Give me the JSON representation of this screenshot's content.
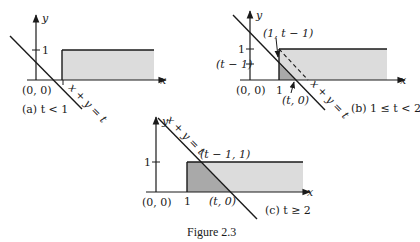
{
  "figure": {
    "caption": "Figure 2.3",
    "colors": {
      "ink": "#1a1a1a",
      "light_shade": "#dcdcdc",
      "dark_shade": "#a9a9a9"
    },
    "panels": [
      {
        "id": "a",
        "caption": "(a) t < 1",
        "axis_x_label": "x",
        "axis_y_label": "y",
        "origin_label": "(0, 0)",
        "y_tick_labels": [
          "1"
        ],
        "x_tick_labels": [
          "1"
        ],
        "line_label": "x + y = t"
      },
      {
        "id": "b",
        "caption": "(b) 1 ≤ t < 2",
        "axis_x_label": "x",
        "axis_y_label": "y",
        "origin_label": "(0, 0)",
        "y_tick_labels": [
          "1",
          "(t − 1)"
        ],
        "x_tick_labels": [
          "1"
        ],
        "point_labels": [
          "(1, t − 1)",
          "(t, 0)"
        ],
        "line_label": "x + y = t"
      },
      {
        "id": "c",
        "caption": "(c) t ≥ 2",
        "axis_x_label": "x",
        "axis_y_label": "y",
        "origin_label": "(0, 0)",
        "y_tick_labels": [
          "1"
        ],
        "x_tick_labels": [
          "1"
        ],
        "point_labels": [
          "(t − 1, 1)",
          "(t, 0)"
        ],
        "line_label": "x + y = t"
      }
    ]
  }
}
